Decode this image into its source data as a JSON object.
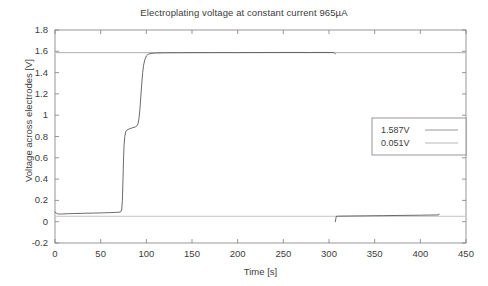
{
  "chart_data": {
    "type": "line",
    "title": "Electroplating voltage at constant current 965µA",
    "xlabel": "Time [s]",
    "ylabel": "Voltage across electrodes [V]",
    "xlim": [
      0,
      450
    ],
    "ylim": [
      -0.2,
      1.8
    ],
    "xticks": [
      "0",
      "50",
      "100",
      "150",
      "200",
      "250",
      "300",
      "350",
      "400",
      "450"
    ],
    "xtick_values": [
      0,
      50,
      100,
      150,
      200,
      250,
      300,
      350,
      400,
      450
    ],
    "yticks": [
      "1.8",
      "1.6",
      "1.4",
      "1.2",
      "1",
      "0.8",
      "0.6",
      "0.4",
      "0.2",
      "0",
      "-0.2"
    ],
    "ytick_values": [
      1.8,
      1.6,
      1.4,
      1.2,
      1.0,
      0.8,
      0.6,
      0.4,
      0.2,
      0,
      -0.2
    ],
    "grid": false,
    "legend_position": "center-right",
    "legend": [
      {
        "label": "1.587V",
        "value": 1.587,
        "color": "#8c8c8c"
      },
      {
        "label": "0.051V",
        "value": 0.051,
        "color": "#b0b0b0"
      }
    ],
    "series": [
      {
        "name": "electroplating-voltage",
        "color": "#5a5a5a",
        "points": [
          [
            0,
            0.093
          ],
          [
            1.5,
            0.079
          ],
          [
            3,
            0.073
          ],
          [
            5,
            0.072
          ],
          [
            8,
            0.073
          ],
          [
            14,
            0.075
          ],
          [
            22,
            0.077
          ],
          [
            32,
            0.079
          ],
          [
            42,
            0.081
          ],
          [
            52,
            0.083
          ],
          [
            60,
            0.085
          ],
          [
            66,
            0.087
          ],
          [
            70,
            0.089
          ],
          [
            72,
            0.093
          ],
          [
            73,
            0.11
          ],
          [
            73.8,
            0.2
          ],
          [
            74.4,
            0.38
          ],
          [
            75,
            0.58
          ],
          [
            75.6,
            0.72
          ],
          [
            76.4,
            0.8
          ],
          [
            77.5,
            0.845
          ],
          [
            79,
            0.862
          ],
          [
            82,
            0.874
          ],
          [
            85,
            0.882
          ],
          [
            88,
            0.89
          ],
          [
            90,
            0.902
          ],
          [
            91,
            0.925
          ],
          [
            92,
            0.97
          ],
          [
            93,
            1.06
          ],
          [
            94,
            1.18
          ],
          [
            95,
            1.3
          ],
          [
            96,
            1.4
          ],
          [
            97,
            1.47
          ],
          [
            98.5,
            1.525
          ],
          [
            100,
            1.556
          ],
          [
            102,
            1.572
          ],
          [
            105,
            1.58
          ],
          [
            110,
            1.584
          ],
          [
            120,
            1.586
          ],
          [
            140,
            1.587
          ],
          [
            170,
            1.588
          ],
          [
            200,
            1.588
          ],
          [
            240,
            1.589
          ],
          [
            280,
            1.589
          ],
          [
            300,
            1.589
          ],
          [
            305,
            1.589
          ],
          [
            306,
            1.582
          ],
          [
            307,
            1.576
          ]
        ]
      },
      {
        "name": "rest-voltage",
        "color": "#5a5a5a",
        "points": [
          [
            307,
            0.0
          ],
          [
            307.5,
            0.03
          ],
          [
            308,
            0.05
          ],
          [
            310,
            0.052
          ],
          [
            320,
            0.053
          ],
          [
            340,
            0.055
          ],
          [
            360,
            0.057
          ],
          [
            380,
            0.059
          ],
          [
            400,
            0.061
          ],
          [
            415,
            0.063
          ],
          [
            420,
            0.064
          ],
          [
            420.5,
            0.072
          ]
        ]
      }
    ],
    "reference_lines": [
      {
        "name": "upper-reference",
        "value": 1.587,
        "color": "#9a9a9a"
      },
      {
        "name": "lower-reference",
        "value": 0.051,
        "color": "#b4b4b4"
      }
    ]
  }
}
